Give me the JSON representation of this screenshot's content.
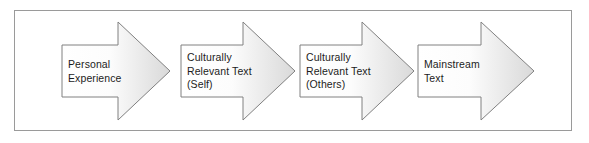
{
  "diagram": {
    "type": "process-flow-chevron",
    "title": "",
    "frame": {
      "x": 14,
      "y": 10,
      "width": 558,
      "height": 121,
      "border_color": "#9a9a9a",
      "background_color": "#ffffff"
    },
    "style": {
      "arrow_outline_color": "#808080",
      "arrow_fill_start": "#ffffff",
      "arrow_fill_end": "#d9d9d9",
      "text_color": "#1c1c1c"
    },
    "steps": [
      {
        "index": 1,
        "label": "Personal\nExperience",
        "label_lines": [
          "Personal",
          "Experience"
        ],
        "tail_x": 62,
        "tip_x": 170,
        "body_top": 45,
        "body_bottom": 97,
        "head_top": 22,
        "head_bottom": 120,
        "head_start_x": 118,
        "label_x": 68,
        "label_y": 58
      },
      {
        "index": 2,
        "label": "Culturally\nRelevant Text\n(Self)",
        "label_lines": [
          "Culturally",
          "Relevant Text",
          "(Self)"
        ],
        "tail_x": 181,
        "tip_x": 295,
        "body_top": 45,
        "body_bottom": 97,
        "head_top": 22,
        "head_bottom": 120,
        "head_start_x": 243,
        "label_x": 187,
        "label_y": 51
      },
      {
        "index": 3,
        "label": "Culturally\nRelevant Text\n(Others)",
        "label_lines": [
          "Culturally",
          "Relevant Text",
          "(Others)"
        ],
        "tail_x": 300,
        "tip_x": 414,
        "body_top": 45,
        "body_bottom": 97,
        "head_top": 22,
        "head_bottom": 120,
        "head_start_x": 362,
        "label_x": 306,
        "label_y": 51
      },
      {
        "index": 4,
        "label": "Mainstream\nText",
        "label_lines": [
          "Mainstream",
          "Text"
        ],
        "tail_x": 418,
        "tip_x": 534,
        "body_top": 45,
        "body_bottom": 97,
        "head_top": 22,
        "head_bottom": 120,
        "head_start_x": 481,
        "label_x": 424,
        "label_y": 58
      }
    ]
  }
}
